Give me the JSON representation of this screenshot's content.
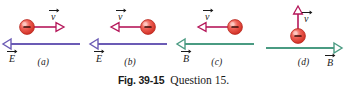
{
  "figure": {
    "caption_figure_number": "Fig. 39-15",
    "caption_text": "Question 15.",
    "background_color": "#ffffff"
  },
  "colors": {
    "particle_fill": "#e8453c",
    "particle_highlight": "#f8a39a",
    "particle_edge": "#b8281f",
    "velocity_arrow": "#b5175a",
    "efield_line": "#6b5bb5",
    "bfield_line": "#4a9b82",
    "label_text": "#1a1a1a"
  },
  "panels": [
    {
      "id": "a",
      "label": "(a)",
      "particle": {
        "charge_sign": "−",
        "position": "left",
        "name": "negative-charge"
      },
      "velocity": {
        "label": "v",
        "direction": "right",
        "arrow_style": "hollow-head"
      },
      "field": {
        "type": "E",
        "label": "E",
        "direction": "left",
        "color_key": "efield_line",
        "label_side": "left"
      }
    },
    {
      "id": "b",
      "label": "(b)",
      "particle": {
        "charge_sign": "−",
        "position": "right",
        "name": "negative-charge"
      },
      "velocity": {
        "label": "v",
        "direction": "left",
        "arrow_style": "hollow-head"
      },
      "field": {
        "type": "E",
        "label": "E",
        "direction": "left",
        "color_key": "efield_line",
        "label_side": "left"
      }
    },
    {
      "id": "c",
      "label": "(c)",
      "particle": {
        "charge_sign": "−",
        "position": "right",
        "name": "negative-charge"
      },
      "velocity": {
        "label": "v",
        "direction": "left",
        "arrow_style": "hollow-head"
      },
      "field": {
        "type": "B",
        "label": "B",
        "direction": "left",
        "color_key": "bfield_line",
        "label_side": "left"
      }
    },
    {
      "id": "d",
      "label": "(d)",
      "particle": {
        "charge_sign": "−",
        "position": "center",
        "name": "negative-charge"
      },
      "velocity": {
        "label": "v",
        "direction": "up",
        "arrow_style": "hollow-head"
      },
      "field": {
        "type": "B",
        "label": "B",
        "direction": "right",
        "color_key": "bfield_line",
        "label_side": "right"
      }
    }
  ]
}
